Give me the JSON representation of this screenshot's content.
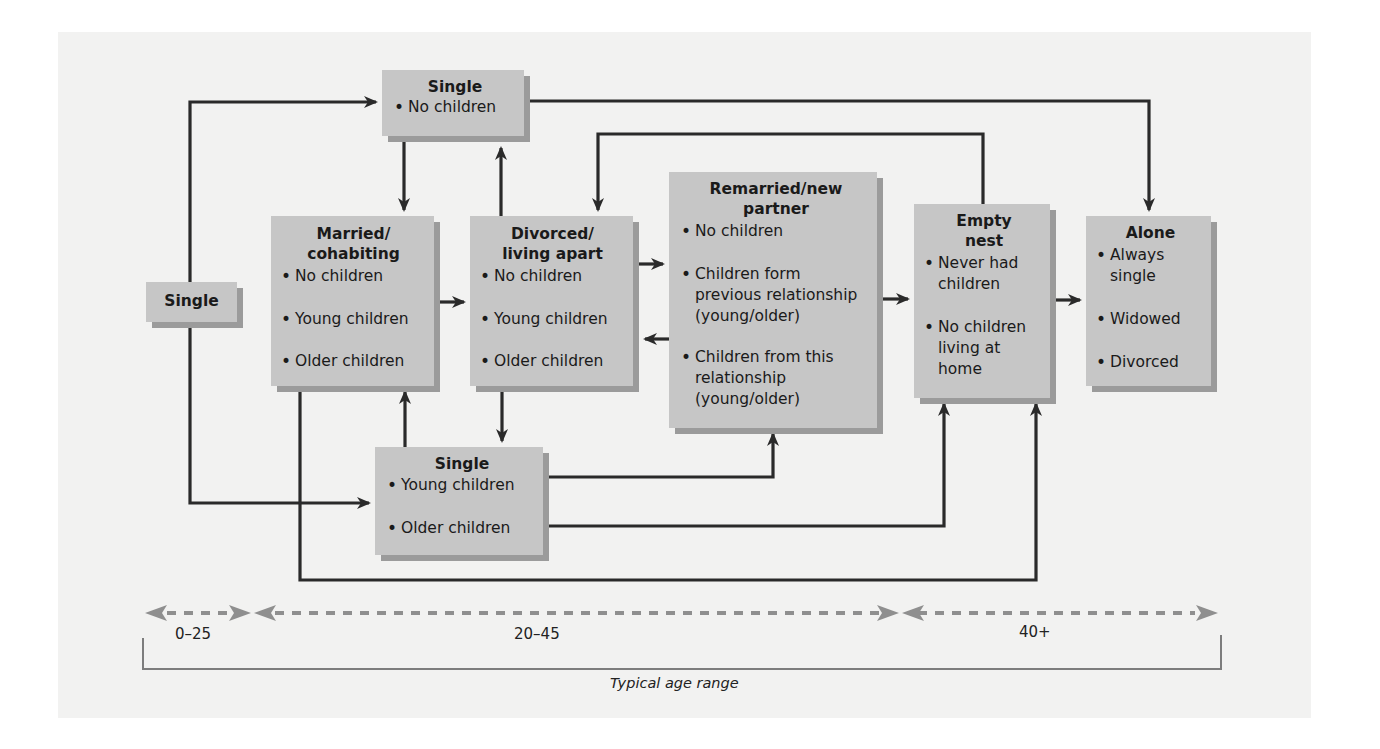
{
  "diagram": {
    "type": "flow",
    "title": "",
    "colors": {
      "panel": "#f2f2f1",
      "box_fill": "#c6c6c6",
      "box_shadow": "#9b9b9b",
      "arrow": "#2a2a2a",
      "age_arrow": "#8f8f8f"
    },
    "nodes": {
      "single_start": {
        "title": "Single",
        "items": []
      },
      "single_no_children": {
        "title": "Single",
        "items": [
          "No children"
        ]
      },
      "married": {
        "title": "Married/ cohabiting",
        "title_lines": [
          "Married/",
          "cohabiting"
        ],
        "items": [
          "No children",
          "Young children",
          "Older children"
        ]
      },
      "divorced": {
        "title": "Divorced/ living apart",
        "title_lines": [
          "Divorced/",
          "living apart"
        ],
        "items": [
          "No children",
          "Young children",
          "Older children"
        ]
      },
      "remarried": {
        "title": "Remarried/new partner",
        "title_lines": [
          "Remarried/new",
          "partner"
        ],
        "items": [
          "No children",
          "Children form previous relationship (young/older)",
          "Children from this relationship (young/older)"
        ]
      },
      "empty_nest": {
        "title": "Empty nest",
        "title_lines": [
          "Empty",
          "nest"
        ],
        "items": [
          "Never had children",
          "No children living at home"
        ]
      },
      "alone": {
        "title": "Alone",
        "items": [
          "Always single",
          "Widowed",
          "Divorced"
        ]
      },
      "single_with_children": {
        "title": "Single",
        "items": [
          "Young children",
          "Older children"
        ]
      }
    },
    "edges": [
      {
        "from": "single_start",
        "to": "single_no_children"
      },
      {
        "from": "single_start",
        "to": "single_with_children"
      },
      {
        "from": "single_no_children",
        "to": "married"
      },
      {
        "from": "single_no_children",
        "to": "alone"
      },
      {
        "from": "divorced",
        "to": "single_no_children"
      },
      {
        "from": "married",
        "to": "divorced"
      },
      {
        "from": "married",
        "to": "empty_nest"
      },
      {
        "from": "divorced",
        "to": "remarried"
      },
      {
        "from": "remarried",
        "to": "divorced"
      },
      {
        "from": "divorced",
        "to": "single_with_children"
      },
      {
        "from": "empty_nest",
        "to": "divorced"
      },
      {
        "from": "remarried",
        "to": "empty_nest"
      },
      {
        "from": "empty_nest",
        "to": "alone"
      },
      {
        "from": "single_with_children",
        "to": "married"
      },
      {
        "from": "single_with_children",
        "to": "remarried"
      },
      {
        "from": "single_with_children",
        "to": "empty_nest"
      }
    ],
    "age_ranges": [
      {
        "label": "0–25"
      },
      {
        "label": "20–45"
      },
      {
        "label": "40+"
      }
    ],
    "age_caption": "Typical age range"
  }
}
